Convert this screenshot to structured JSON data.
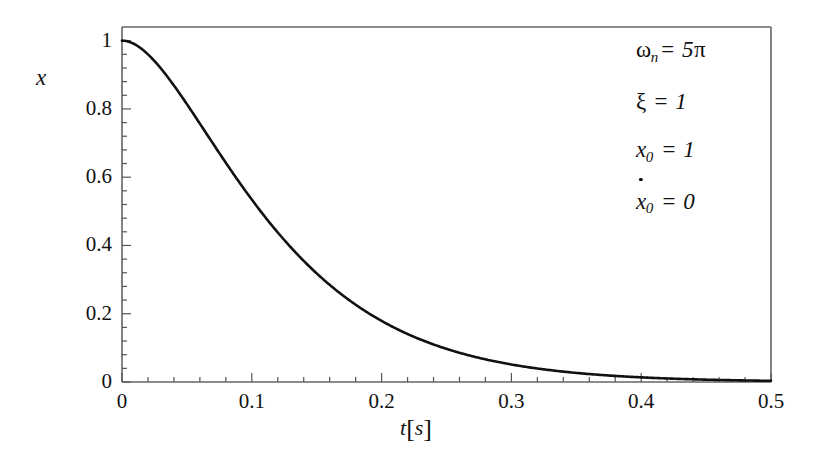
{
  "figure": {
    "background": "#ffffff",
    "line_color": "#111111",
    "frame_color": "#555555"
  },
  "axes": {
    "ylabel": "x",
    "xlabel_var": "t",
    "xlabel_unit": "s",
    "xlabel_open": "[",
    "xlabel_close": "]",
    "xticks": [
      "0",
      "0.1",
      "0.2",
      "0.3",
      "0.4",
      "0.5"
    ],
    "yticks": [
      "0",
      "0.2",
      "0.4",
      "0.6",
      "0.8",
      "1"
    ]
  },
  "annotations": {
    "omega_symbol": "ω",
    "omega_sub": "n",
    "omega_eq": "= 5",
    "omega_pi": "π",
    "zeta_symbol": "ξ",
    "zeta_eq": "= 1",
    "x0_var": "x",
    "x0_sub": "0",
    "x0_eq": "= 1",
    "xdot0_var": "x",
    "xdot0_sub": "0",
    "xdot0_eq": "= 0"
  },
  "chart_data": {
    "type": "line",
    "title": "",
    "xlabel": "t [s]",
    "ylabel": "x",
    "xlim": [
      0,
      0.5
    ],
    "ylim": [
      0,
      1.04
    ],
    "grid": false,
    "legend": false,
    "equation": "x(t) = (1 + ωn t) e^(-ωn t)",
    "parameters": {
      "omega_n": 15.70796,
      "omega_n_label": "5π",
      "zeta": 1,
      "x0": 1,
      "xdot0": 0
    },
    "xticks": [
      0,
      0.1,
      0.2,
      0.3,
      0.4,
      0.5
    ],
    "yticks": [
      0,
      0.2,
      0.4,
      0.6,
      0.8,
      1
    ],
    "x_minor_step": 0.02,
    "y_minor_step": 0.04,
    "series": [
      {
        "name": "x(t)",
        "color": "#111111",
        "x": [
          0,
          0.0125,
          0.025,
          0.0375,
          0.05,
          0.0625,
          0.075,
          0.0875,
          0.1,
          0.1125,
          0.125,
          0.1375,
          0.15,
          0.1625,
          0.175,
          0.1875,
          0.2,
          0.2125,
          0.225,
          0.2375,
          0.25,
          0.275,
          0.3,
          0.325,
          0.35,
          0.375,
          0.4,
          0.425,
          0.45,
          0.475,
          0.5
        ],
        "y": [
          1.0,
          0.9824,
          0.9351,
          0.8672,
          0.7866,
          0.7001,
          0.6128,
          0.5288,
          0.4505,
          0.3796,
          0.3166,
          0.2617,
          0.2145,
          0.1744,
          0.1408,
          0.1128,
          0.0898,
          0.0711,
          0.0559,
          0.0437,
          0.034,
          0.0203,
          0.012,
          0.007,
          0.004,
          0.0023,
          0.0013,
          0.0007,
          0.0004,
          0.0002,
          0.0001
        ]
      }
    ]
  }
}
